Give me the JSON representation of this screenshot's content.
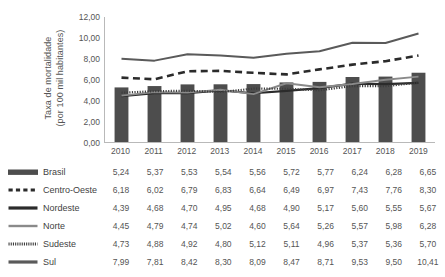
{
  "chart_data": {
    "type": "bar",
    "title": "",
    "xlabel": "",
    "ylabel": "Taxa de mortalidade\n(por 100 mil habitantes)",
    "categories": [
      "2010",
      "2011",
      "2012",
      "2013",
      "2014",
      "2015",
      "2016",
      "2017",
      "2018",
      "2019"
    ],
    "ylim": [
      0,
      12
    ],
    "ytick_labels": [
      "12,00",
      "10,00",
      "8,00",
      "6,00",
      "4,00",
      "2,00",
      "0,00"
    ],
    "ytick_values": [
      12,
      10,
      8,
      6,
      4,
      2,
      0
    ],
    "grid": false,
    "legend_position": "left-table",
    "series": [
      {
        "name": "Brasil",
        "render": "bar",
        "marker": "bar-swatch",
        "color": "#4d4d4d",
        "values": [
          5.24,
          5.37,
          5.53,
          5.54,
          5.56,
          5.72,
          5.77,
          6.24,
          6.28,
          6.65
        ],
        "labels": [
          "5,24",
          "5,37",
          "5,53",
          "5,54",
          "5,56",
          "5,72",
          "5,77",
          "6,24",
          "6,28",
          "6,65"
        ]
      },
      {
        "name": "Centro-Oeste",
        "render": "line",
        "marker": "dashed-line",
        "color": "#2b2b2b",
        "values": [
          6.18,
          6.02,
          6.79,
          6.83,
          6.64,
          6.49,
          6.97,
          7.43,
          7.76,
          8.3
        ],
        "labels": [
          "6,18",
          "6,02",
          "6,79",
          "6,83",
          "6,64",
          "6,49",
          "6,97",
          "7,43",
          "7,76",
          "8,30"
        ]
      },
      {
        "name": "Nordeste",
        "render": "line",
        "marker": "solid-thick-line",
        "color": "#2b2b2b",
        "values": [
          4.39,
          4.68,
          4.7,
          4.95,
          4.68,
          4.9,
          5.17,
          5.6,
          5.55,
          5.67
        ],
        "labels": [
          "4,39",
          "4,68",
          "4,70",
          "4,95",
          "4,68",
          "4,90",
          "5,17",
          "5,60",
          "5,55",
          "5,67"
        ]
      },
      {
        "name": "Norte",
        "render": "line",
        "marker": "solid-gray-line",
        "color": "#8a8a8a",
        "values": [
          4.45,
          4.79,
          4.74,
          5.02,
          4.6,
          5.64,
          5.26,
          5.57,
          5.98,
          6.28
        ],
        "labels": [
          "4,45",
          "4,79",
          "4,74",
          "5,02",
          "4,60",
          "5,64",
          "5,26",
          "5,57",
          "5,98",
          "6,28"
        ]
      },
      {
        "name": "Sudeste",
        "render": "line",
        "marker": "dotted-line",
        "color": "#3d3d3d",
        "values": [
          4.73,
          4.88,
          4.92,
          4.8,
          5.12,
          5.11,
          4.96,
          5.37,
          5.36,
          5.7
        ],
        "labels": [
          "4,73",
          "4,88",
          "4,92",
          "4,80",
          "5,12",
          "5,11",
          "4,96",
          "5,37",
          "5,36",
          "5,70"
        ]
      },
      {
        "name": "Sul",
        "render": "line",
        "marker": "solid-dark-line",
        "color": "#5a5a5a",
        "values": [
          7.99,
          7.81,
          8.42,
          8.3,
          8.09,
          8.47,
          8.71,
          9.53,
          9.5,
          10.41
        ],
        "labels": [
          "7,99",
          "7,81",
          "8,42",
          "8,30",
          "8,09",
          "8,47",
          "8,71",
          "9,53",
          "9,50",
          "10,41"
        ]
      }
    ]
  },
  "colors": {
    "axis": "#b9b9b9",
    "text": "#555555",
    "bar": "#4d4d4d",
    "background": "#ffffff"
  }
}
